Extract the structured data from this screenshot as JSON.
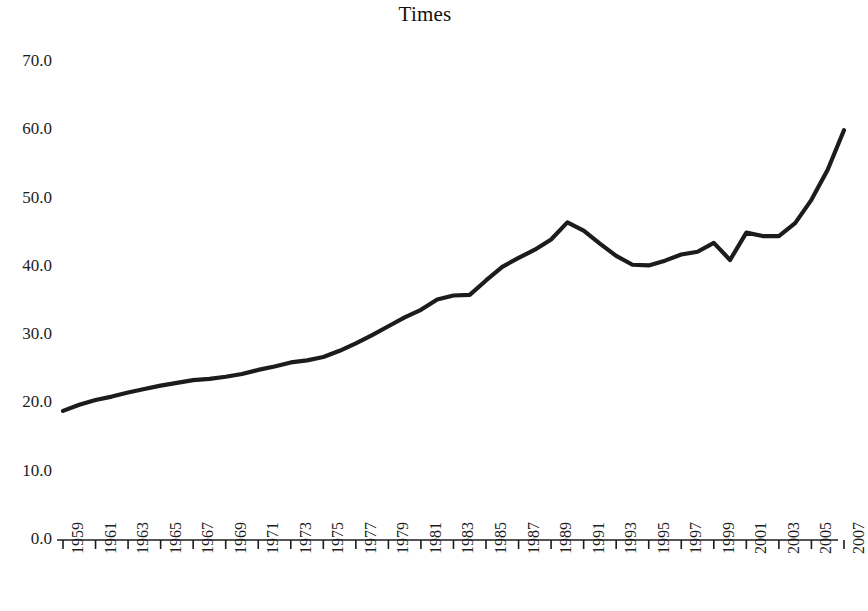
{
  "chart_data": {
    "type": "line",
    "title": "Times",
    "xlabel": "",
    "ylabel": "",
    "grid": false,
    "legend": null,
    "ylim": [
      0.0,
      70.0
    ],
    "xlim": [
      1959,
      2007
    ],
    "y_ticks": [
      "0.0",
      "10.0",
      "20.0",
      "30.0",
      "40.0",
      "50.0",
      "60.0",
      "70.0"
    ],
    "y_tick_values": [
      0.0,
      10.0,
      20.0,
      30.0,
      40.0,
      50.0,
      60.0,
      70.0
    ],
    "x_tick_labels": [
      "1959",
      "1961",
      "1963",
      "1965",
      "1967",
      "1969",
      "1971",
      "1973",
      "1975",
      "1977",
      "1979",
      "1981",
      "1983",
      "1985",
      "1987",
      "1989",
      "1991",
      "1993",
      "1995",
      "1997",
      "1999",
      "2001",
      "2003",
      "2005",
      "2007"
    ],
    "x": [
      1959,
      1960,
      1961,
      1962,
      1963,
      1964,
      1965,
      1966,
      1967,
      1968,
      1969,
      1970,
      1971,
      1972,
      1973,
      1974,
      1975,
      1976,
      1977,
      1978,
      1979,
      1980,
      1981,
      1982,
      1983,
      1984,
      1985,
      1986,
      1987,
      1988,
      1989,
      1990,
      1991,
      1992,
      1993,
      1994,
      1995,
      1996,
      1997,
      1998,
      1999,
      2000,
      2001,
      2002,
      2003,
      2004,
      2005,
      2006,
      2007
    ],
    "series": [
      {
        "name": "Times",
        "color": "#1c1c1c",
        "values": [
          18.9,
          19.8,
          20.5,
          21.0,
          21.6,
          22.1,
          22.6,
          23.0,
          23.4,
          23.6,
          23.9,
          24.3,
          24.9,
          25.4,
          26.0,
          26.3,
          26.8,
          27.7,
          28.8,
          30.0,
          31.3,
          32.6,
          33.7,
          35.2,
          35.8,
          35.9,
          38.0,
          40.0,
          41.3,
          42.5,
          44.0,
          46.5,
          45.3,
          43.4,
          41.6,
          40.3,
          40.2,
          40.9,
          41.8,
          42.2,
          43.5,
          41.0,
          45.0,
          44.5,
          44.5,
          46.4,
          49.8,
          54.2,
          60.0
        ]
      }
    ]
  }
}
